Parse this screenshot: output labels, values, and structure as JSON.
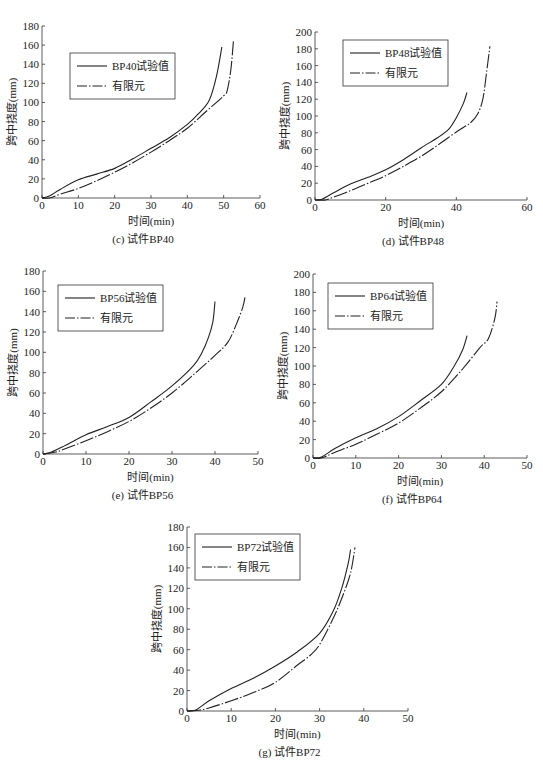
{
  "figure": {
    "panels": [
      {
        "id": "c",
        "caption": "(c) 试件BP40",
        "legend": [
          "BP40试验值",
          "有限元"
        ]
      },
      {
        "id": "d",
        "caption": "(d) 试件BP48",
        "legend": [
          "BP48试验值",
          "有限元"
        ]
      },
      {
        "id": "e",
        "caption": "(e) 试件BP56",
        "legend": [
          "BP56试验值",
          "有限元"
        ]
      },
      {
        "id": "f",
        "caption": "(f) 试件BP64",
        "legend": [
          "BP64试验值",
          "有限元"
        ]
      },
      {
        "id": "g",
        "caption": "(g) 试件BP72",
        "legend": [
          "BP72试验值",
          "有限元"
        ]
      }
    ]
  },
  "chart_data": [
    {
      "type": "line",
      "title": "(c) 试件BP40",
      "xlabel": "时间(min)",
      "ylabel": "跨中挠度(mm)",
      "xlim": [
        0,
        60
      ],
      "ylim": [
        0,
        180
      ],
      "xticks": [
        0,
        10,
        20,
        30,
        40,
        50,
        60
      ],
      "yticks": [
        0,
        20,
        40,
        60,
        80,
        100,
        120,
        140,
        160,
        180
      ],
      "grid": false,
      "legend_position": "upper-left-inside",
      "series": [
        {
          "name": "BP40试验值",
          "style": "solid",
          "x": [
            0,
            2,
            5,
            10,
            15,
            20,
            25,
            30,
            35,
            40,
            43,
            46,
            48,
            49.5
          ],
          "y": [
            0,
            2,
            9,
            19,
            25,
            31,
            41,
            52,
            63,
            77,
            88,
            102,
            127,
            158
          ]
        },
        {
          "name": "有限元",
          "style": "dash-dot",
          "x": [
            0,
            2,
            5,
            10,
            15,
            20,
            25,
            30,
            35,
            40,
            45,
            50,
            51,
            52,
            52.7
          ],
          "y": [
            0,
            0,
            4,
            10,
            18,
            27,
            37,
            48,
            60,
            73,
            90,
            107,
            113,
            135,
            165
          ]
        }
      ]
    },
    {
      "type": "line",
      "title": "(d) 试件BP48",
      "xlabel": "时间(min)",
      "ylabel": "跨中挠度(mm)",
      "xlim": [
        0,
        60
      ],
      "ylim": [
        0,
        200
      ],
      "xticks": [
        0,
        20,
        40,
        60
      ],
      "yticks": [
        0,
        20,
        40,
        60,
        80,
        100,
        120,
        140,
        160,
        180,
        200
      ],
      "grid": false,
      "legend_position": "upper-left-inside",
      "series": [
        {
          "name": "BP48试验值",
          "style": "solid",
          "x": [
            0,
            2,
            5,
            10,
            15,
            20,
            25,
            30,
            35,
            38,
            40,
            42,
            43
          ],
          "y": [
            0,
            1,
            8,
            19,
            27,
            36,
            48,
            62,
            75,
            85,
            98,
            115,
            128
          ]
        },
        {
          "name": "有限元",
          "style": "dash-dot",
          "x": [
            0,
            3,
            5,
            10,
            15,
            20,
            25,
            30,
            35,
            40,
            44,
            46,
            47.5,
            48.5,
            49.5
          ],
          "y": [
            0,
            0,
            3,
            11,
            20,
            29,
            40,
            52,
            66,
            81,
            92,
            102,
            120,
            150,
            183
          ]
        }
      ]
    },
    {
      "type": "line",
      "title": "(e) 试件BP56",
      "xlabel": "时间(min)",
      "ylabel": "跨中挠度(mm)",
      "xlim": [
        0,
        50
      ],
      "ylim": [
        0,
        180
      ],
      "xticks": [
        0,
        10,
        20,
        30,
        40,
        50
      ],
      "yticks": [
        0,
        20,
        40,
        60,
        80,
        100,
        120,
        140,
        160,
        180
      ],
      "grid": false,
      "legend_position": "upper-left-inside",
      "series": [
        {
          "name": "BP56试验值",
          "style": "solid",
          "x": [
            0,
            2,
            5,
            10,
            15,
            20,
            25,
            30,
            35,
            37,
            38.5,
            39.5,
            40
          ],
          "y": [
            0,
            2,
            8,
            19,
            27,
            36,
            51,
            67,
            87,
            100,
            115,
            130,
            150
          ]
        },
        {
          "name": "有限元",
          "style": "dash-dot",
          "x": [
            0,
            3,
            5,
            10,
            15,
            20,
            25,
            30,
            35,
            40,
            43,
            45,
            46.5,
            47
          ],
          "y": [
            0,
            2,
            5,
            13,
            22,
            32,
            45,
            60,
            78,
            97,
            110,
            128,
            145,
            155
          ]
        }
      ]
    },
    {
      "type": "line",
      "title": "(f) 试件BP64",
      "xlabel": "时间(min)",
      "ylabel": "跨中挠度(mm)",
      "xlim": [
        0,
        50
      ],
      "ylim": [
        0,
        200
      ],
      "xticks": [
        0,
        10,
        20,
        30,
        40,
        50
      ],
      "yticks": [
        0,
        20,
        40,
        60,
        80,
        100,
        120,
        140,
        160,
        180,
        200
      ],
      "grid": false,
      "legend_position": "upper-left-inside",
      "series": [
        {
          "name": "BP64试验值",
          "style": "solid",
          "x": [
            0,
            2,
            5,
            10,
            15,
            20,
            25,
            30,
            33,
            35,
            36
          ],
          "y": [
            0,
            1,
            10,
            22,
            32,
            45,
            62,
            80,
            100,
            118,
            133
          ]
        },
        {
          "name": "有限元",
          "style": "dash-dot",
          "x": [
            0,
            2,
            5,
            10,
            15,
            20,
            25,
            30,
            35,
            39,
            41,
            42.5,
            43
          ],
          "y": [
            0,
            0,
            6,
            15,
            26,
            38,
            54,
            72,
            97,
            120,
            130,
            152,
            170
          ]
        }
      ]
    },
    {
      "type": "line",
      "title": "(g) 试件BP72",
      "xlabel": "时间(min)",
      "ylabel": "跨中挠度(mm)",
      "xlim": [
        0,
        50
      ],
      "ylim": [
        0,
        180
      ],
      "xticks": [
        0,
        10,
        20,
        30,
        40,
        50
      ],
      "yticks": [
        0,
        20,
        40,
        60,
        80,
        100,
        120,
        140,
        160,
        180
      ],
      "grid": false,
      "legend_position": "upper-left-inside",
      "series": [
        {
          "name": "BP72试验值",
          "style": "solid",
          "x": [
            0,
            2,
            5,
            10,
            15,
            20,
            25,
            30,
            33,
            35,
            36.5,
            37
          ],
          "y": [
            0,
            1,
            10,
            22,
            32,
            44,
            58,
            76,
            97,
            120,
            145,
            158
          ]
        },
        {
          "name": "有限元",
          "style": "dash-dot",
          "x": [
            0,
            3,
            5,
            10,
            15,
            20,
            25,
            28,
            30,
            33,
            35,
            37,
            38
          ],
          "y": [
            0,
            1,
            3,
            10,
            18,
            28,
            45,
            55,
            65,
            90,
            110,
            135,
            160
          ]
        }
      ]
    }
  ]
}
